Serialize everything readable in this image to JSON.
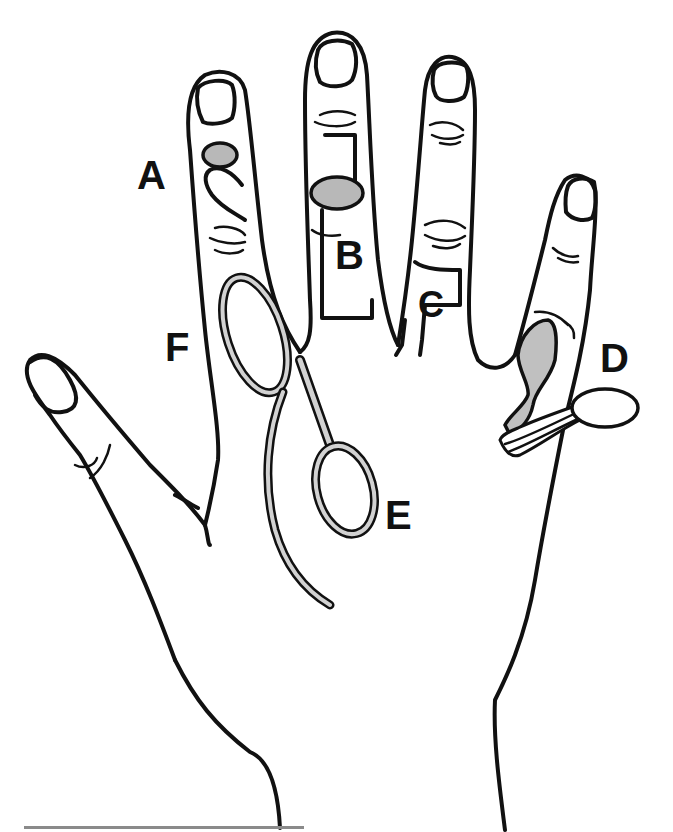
{
  "figure": {
    "colors": {
      "line": "#111111",
      "fill_gray": "#b8b8b8",
      "instrument_fill": "#d2d2d2",
      "rule": "#8a8a8a",
      "background": "#ffffff"
    },
    "labels": [
      {
        "id": "A",
        "text": "A",
        "x": 137,
        "y": 155
      },
      {
        "id": "B",
        "text": "B",
        "x": 335,
        "y": 235
      },
      {
        "id": "C",
        "text": "C",
        "x": 418,
        "y": 287
      },
      {
        "id": "D",
        "text": "D",
        "x": 600,
        "y": 338
      },
      {
        "id": "E",
        "text": "E",
        "x": 385,
        "y": 495
      },
      {
        "id": "F",
        "text": "F",
        "x": 165,
        "y": 327
      }
    ]
  }
}
